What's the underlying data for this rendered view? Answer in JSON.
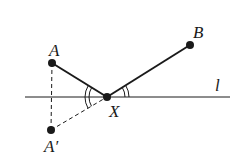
{
  "diagram": {
    "type": "geometry-reflection",
    "labels": {
      "point_a": "A",
      "point_b": "B",
      "point_x": "X",
      "point_a_prime": "A′",
      "line_l": "l"
    },
    "points": {
      "A": [
        52,
        63
      ],
      "B": [
        190,
        45
      ],
      "X": [
        107,
        97
      ],
      "A_prime": [
        51,
        130
      ]
    },
    "line_l": {
      "y": 97,
      "x_start": 25,
      "x_end": 230
    },
    "colors": {
      "stroke": "#1a1a1a",
      "background": "#ffffff"
    }
  }
}
